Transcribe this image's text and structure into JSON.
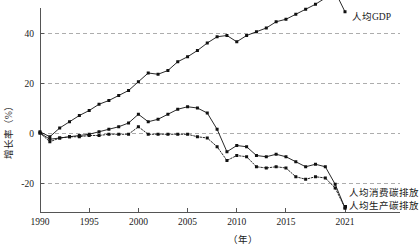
{
  "chart_data": {
    "type": "line",
    "title": "",
    "xlabel": "（年）",
    "ylabel": "增长率（%）",
    "xlim": [
      1990,
      2021
    ],
    "ylim": [
      -30,
      50
    ],
    "grid": true,
    "grid_values": [
      40,
      20,
      0,
      -20
    ],
    "x_ticks": [
      1990,
      1995,
      2000,
      2005,
      2010,
      2015,
      2021
    ],
    "y_ticks": [
      40,
      20,
      0,
      -20
    ],
    "legend_position": "inline-right",
    "x": [
      1990,
      1991,
      1992,
      1993,
      1994,
      1995,
      1996,
      1997,
      1998,
      1999,
      2000,
      2001,
      2002,
      2003,
      2004,
      2005,
      2006,
      2007,
      2008,
      2009,
      2010,
      2011,
      2012,
      2013,
      2014,
      2015,
      2016,
      2017,
      2018,
      2019,
      2020,
      2021
    ],
    "series": [
      {
        "name": "人均GDP",
        "label": "人均GDP",
        "style": "solid",
        "marker": "square",
        "values": [
          0.5,
          -1.5,
          2.0,
          4.5,
          7.0,
          9.0,
          11.5,
          13.0,
          15.0,
          17.0,
          20.5,
          24.0,
          23.5,
          25.0,
          28.5,
          30.5,
          33.0,
          36.0,
          38.5,
          39.0,
          36.5,
          39.0,
          40.5,
          42.0,
          44.5,
          45.5,
          47.5,
          49.5,
          51.5,
          54.0,
          56.5,
          48.5
        ]
      },
      {
        "name": "人均消费碳排放",
        "label": "人均消费碳排放",
        "style": "solid",
        "marker": "square",
        "values": [
          0.0,
          -2.5,
          -2.0,
          -1.5,
          -1.0,
          -0.5,
          0.5,
          1.5,
          2.5,
          4.0,
          7.5,
          4.5,
          5.5,
          7.5,
          9.5,
          10.5,
          10.0,
          8.0,
          1.5,
          -7.5,
          -5.0,
          -5.5,
          -9.0,
          -9.5,
          -8.5,
          -9.5,
          -11.5,
          -13.5,
          -12.5,
          -13.5,
          -20.5,
          -30.0
        ]
      },
      {
        "name": "人均生产碳排放",
        "label": "人均生产碳排放",
        "style": "dotted",
        "marker": "square",
        "values": [
          0.0,
          -3.5,
          -2.0,
          -1.5,
          -1.5,
          -1.0,
          -1.0,
          -0.5,
          -0.5,
          -0.5,
          2.5,
          -0.5,
          -0.5,
          -0.5,
          -0.5,
          -0.5,
          -1.5,
          -2.0,
          -5.5,
          -11.0,
          -9.0,
          -9.5,
          -13.5,
          -14.0,
          -13.5,
          -14.0,
          -17.5,
          -18.5,
          -17.5,
          -18.0,
          -22.0,
          -30.0
        ]
      }
    ]
  },
  "axis": {
    "y_title": "增长率（%）",
    "x_title": "（年）",
    "y_tick_labels": [
      "40",
      "20",
      "0",
      "-20"
    ],
    "x_tick_labels": [
      "1990",
      "1995",
      "2000",
      "2005",
      "2010",
      "2015",
      "2021"
    ]
  },
  "annotations": {
    "gdp_label": "人均GDP",
    "consumption_label": "人均消费碳排放",
    "production_label": "人均生产碳排放"
  },
  "colors": {
    "line": "#111111",
    "grid": "#999999",
    "axis": "#555555",
    "background": "#ffffff"
  }
}
